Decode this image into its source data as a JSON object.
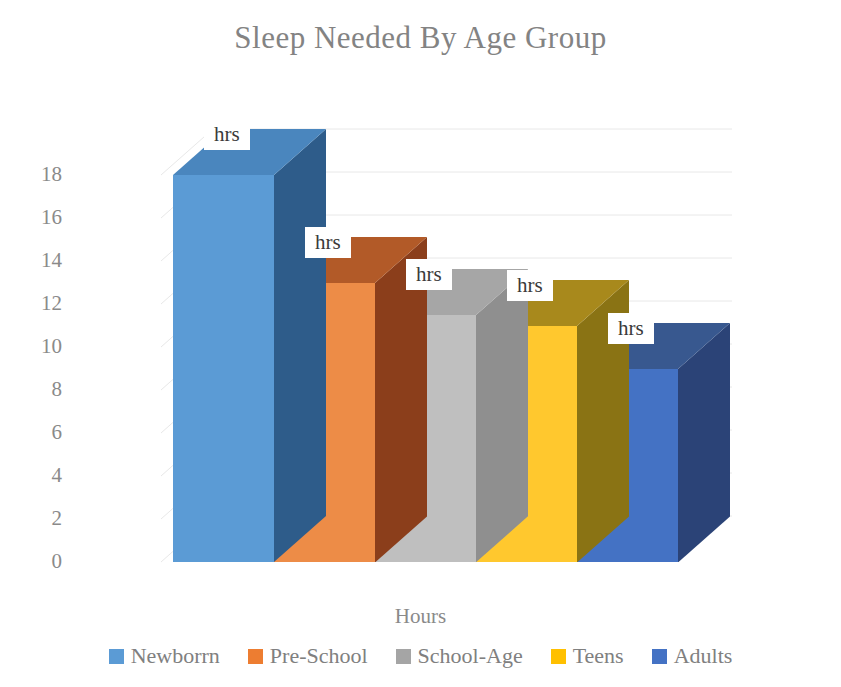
{
  "chart_data": {
    "type": "bar",
    "title": "Sleep Needed By Age Group",
    "subtitle": "",
    "xlabel": "Hours",
    "ylabel": "",
    "categories": [
      "Newborrn",
      "Pre-School",
      "School-Age",
      "Teens",
      "Adults"
    ],
    "values": [
      18,
      13,
      11.5,
      11,
      9
    ],
    "data_labels": [
      "hrs",
      "hrs",
      "hrs",
      "hrs",
      "hrs"
    ],
    "ylim": [
      0,
      18
    ],
    "ytick_labels": [
      "18",
      "16",
      "14",
      "12",
      "10",
      "8",
      "6",
      "4",
      "2",
      "0"
    ],
    "ytick_values": [
      18,
      16,
      14,
      12,
      10,
      8,
      6,
      4,
      2,
      0
    ],
    "grid": true,
    "grid_axis": "y",
    "legend_position": "bottom",
    "three_d": true,
    "series": [
      {
        "name": "Newborrn",
        "value": 18,
        "label": "hrs",
        "color": "#5B9BD5",
        "color_side": "#2E5C8A",
        "color_top": "#4A86BE"
      },
      {
        "name": "Pre-School",
        "value": 13,
        "label": "hrs",
        "color": "#ED8C47",
        "color_side": "#8B3E1B",
        "color_top": "#B25A28"
      },
      {
        "name": "School-Age",
        "value": 11.5,
        "label": "hrs",
        "color": "#BFBFBF",
        "color_side": "#8F8F8F",
        "color_top": "#A6A6A6"
      },
      {
        "name": "Teens",
        "value": 11,
        "label": "hrs",
        "color": "#FFC82E",
        "color_side": "#8A7314",
        "color_top": "#A8891C"
      },
      {
        "name": "Adults",
        "value": 9,
        "label": "hrs",
        "color": "#4472C4",
        "color_side": "#2B4377",
        "color_top": "#38588F"
      }
    ]
  },
  "legend": {
    "items": [
      {
        "label": "Newborrn",
        "color": "#5B9BD5"
      },
      {
        "label": "Pre-School",
        "color": "#ED7D31"
      },
      {
        "label": "School-Age",
        "color": "#A5A5A5"
      },
      {
        "label": "Teens",
        "color": "#FFC000"
      },
      {
        "label": "Adults",
        "color": "#4472C4"
      }
    ]
  },
  "colors": {
    "title_text": "#838383",
    "axis_text": "#8a8a8a",
    "gridline": "#E8E8E8",
    "label_box_bg": "#ffffff",
    "label_box_text": "#3a3a3a",
    "background": "#ffffff"
  }
}
